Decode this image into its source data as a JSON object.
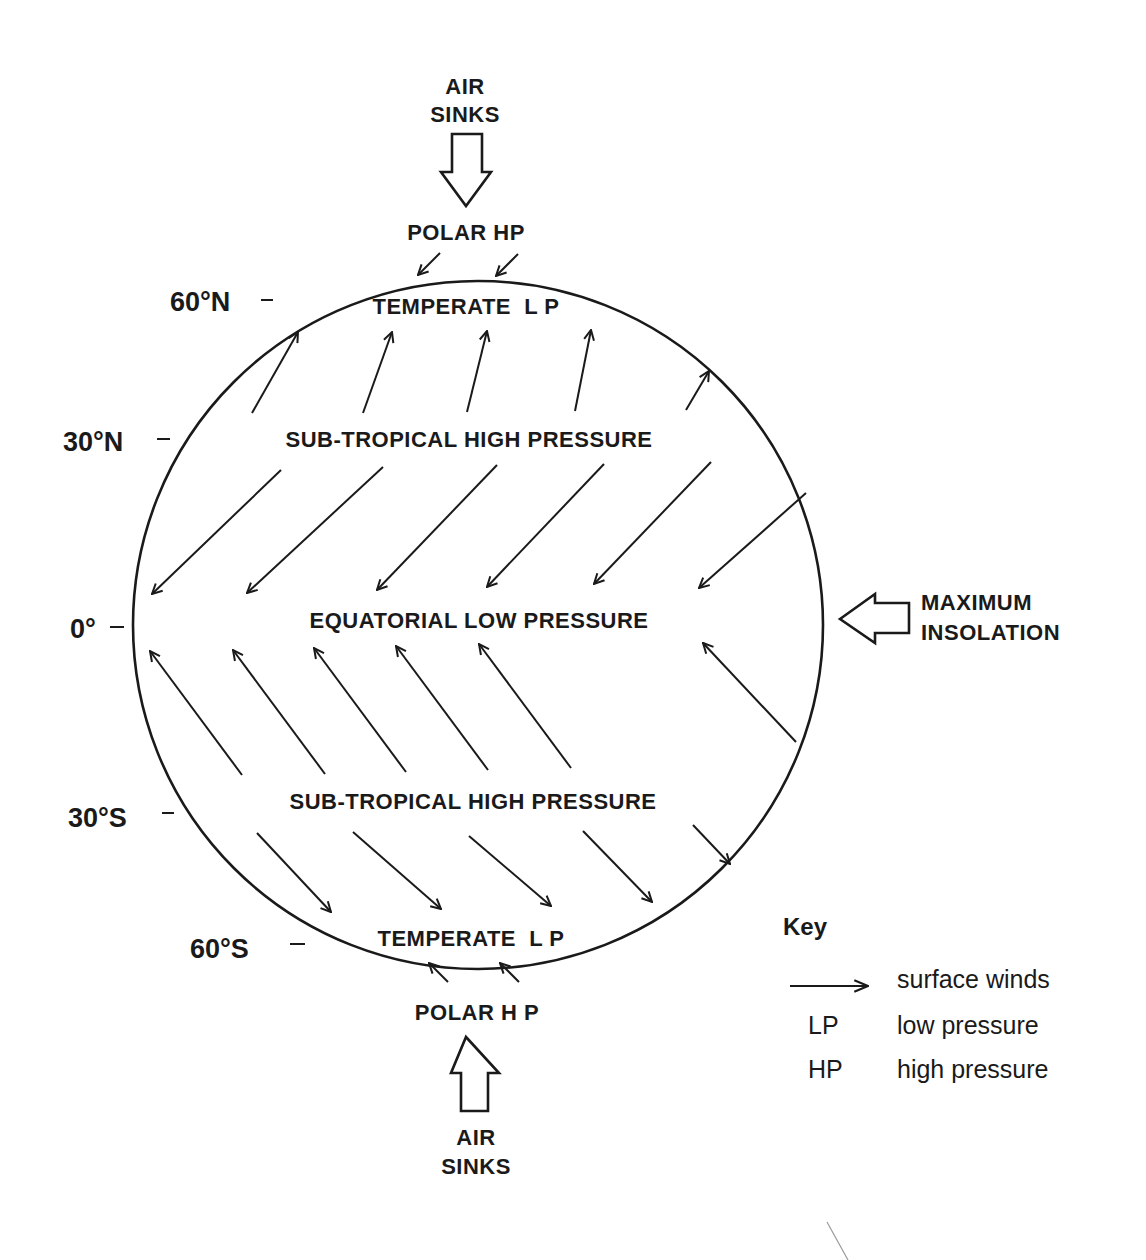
{
  "title_fragment": "",
  "diagram": {
    "top_label": {
      "line1": "AIR",
      "line2": "SINKS"
    },
    "bottom_label": {
      "line1": "AIR",
      "line2": "SINKS"
    },
    "side_label": {
      "line1": "MAXIMUM",
      "line2": "INSOLATION"
    },
    "zones": {
      "polar_hp_north": "POLAR HP",
      "temperate_lp_north": "TEMPERATE  L P",
      "subtropical_hp_north": "SUB-TROPICAL HIGH PRESSURE",
      "equatorial_lp": "EQUATORIAL LOW PRESSURE",
      "subtropical_hp_south": "SUB-TROPICAL HIGH PRESSURE",
      "temperate_lp_south": "TEMPERATE  L P",
      "polar_hp_south": "POLAR H P"
    },
    "latitudes": [
      {
        "label": "60°N",
        "lat": 60
      },
      {
        "label": "30°N",
        "lat": 30
      },
      {
        "label": "0°",
        "lat": 0
      },
      {
        "label": "30°S",
        "lat": -30
      },
      {
        "label": "60°S",
        "lat": -60
      }
    ],
    "wind_bands": [
      {
        "name": "polar-easterlies-north",
        "direction": "south-west",
        "count": 2
      },
      {
        "name": "westerlies-north",
        "direction": "north-east",
        "count": 5
      },
      {
        "name": "trade-winds-north",
        "direction": "south-west",
        "count": 6
      },
      {
        "name": "trade-winds-south",
        "direction": "north-west",
        "count": 6
      },
      {
        "name": "westerlies-south",
        "direction": "south-east",
        "count": 5
      },
      {
        "name": "polar-easterlies-south",
        "direction": "north-west",
        "count": 2
      }
    ]
  },
  "key": {
    "title": "Key",
    "items": [
      {
        "symbol": "arrow",
        "text": "surface winds"
      },
      {
        "symbol": "LP",
        "text": "low pressure"
      },
      {
        "symbol": "HP",
        "text": "high pressure"
      }
    ]
  },
  "colors": {
    "ink": "#1a1a1a",
    "background": "#ffffff"
  }
}
